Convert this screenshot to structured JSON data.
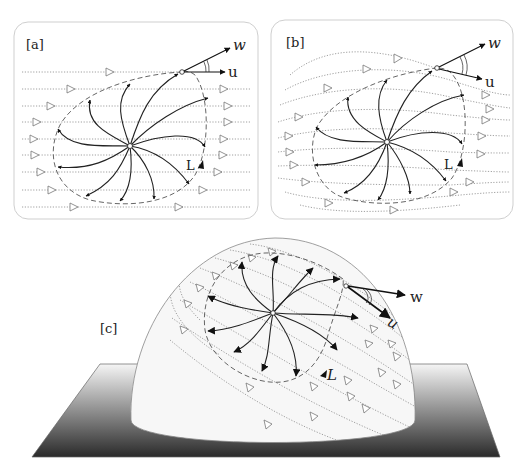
{
  "figure": {
    "panels": [
      {
        "id": "a",
        "label": "[a]",
        "vectors": {
          "w": "w",
          "u": "u",
          "l": "L"
        }
      },
      {
        "id": "b",
        "label": "[b]",
        "vectors": {
          "w": "w",
          "u": "u",
          "l": "L"
        }
      },
      {
        "id": "c",
        "label": "[c]",
        "vectors": {
          "w": "w",
          "u": "u",
          "l": "L"
        }
      }
    ],
    "colors": {
      "background": "#ffffff",
      "frame_border": "#cfcfcf",
      "streamline": "#888888",
      "spiral": "#222222",
      "separatrix": "#555555",
      "dome_fill": "#f7f7f7",
      "plane_top": "#f5f5f5",
      "plane_bottom": "#2a2a2a"
    }
  }
}
